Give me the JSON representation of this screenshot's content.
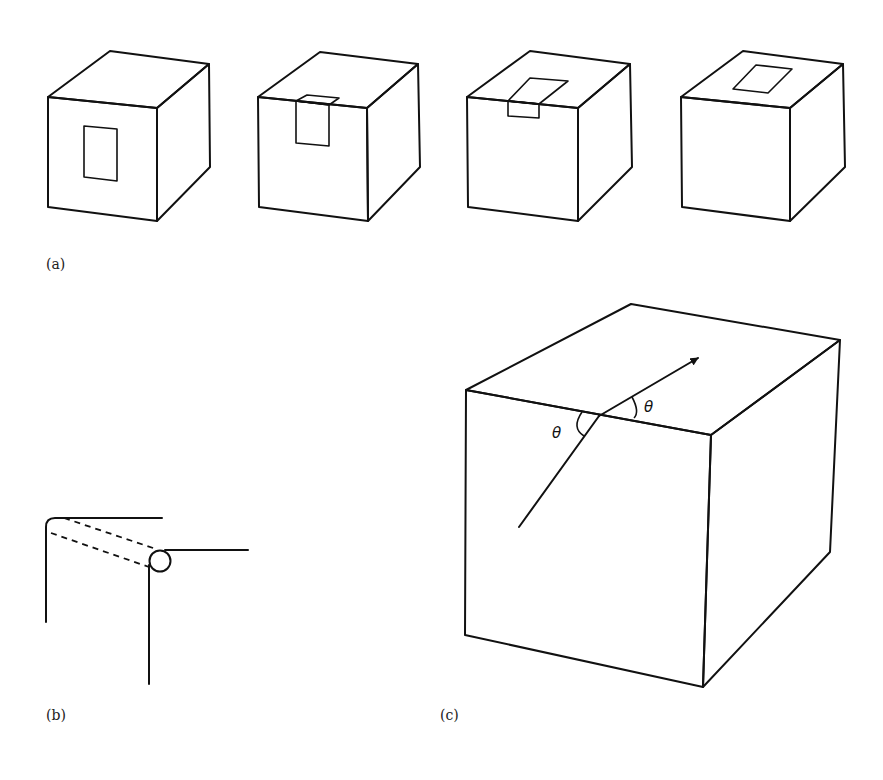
{
  "figure": {
    "panels": [
      {
        "id": "a",
        "label": "(a)",
        "description": "Four cubes showing a rectangular window progressively moving from the front face over the top edge onto the top face",
        "cubes": [
          {
            "index": 1,
            "window_position": "front face center"
          },
          {
            "index": 2,
            "window_position": "front face, touching top edge"
          },
          {
            "index": 3,
            "window_position": "straddling front-top edge"
          },
          {
            "index": 4,
            "window_position": "top face"
          }
        ]
      },
      {
        "id": "b",
        "label": "(b)",
        "description": "Two corner profiles (rounded and with a cylindrical edge) connected by dashed lines"
      },
      {
        "id": "c",
        "label": "(c)",
        "description": "Large cube with an arrow crossing the front-top edge; equal angles marked on both sides",
        "angle_labels": [
          "θ",
          "θ"
        ]
      }
    ],
    "colors": {
      "line": "#111111",
      "background": "#ffffff"
    }
  }
}
